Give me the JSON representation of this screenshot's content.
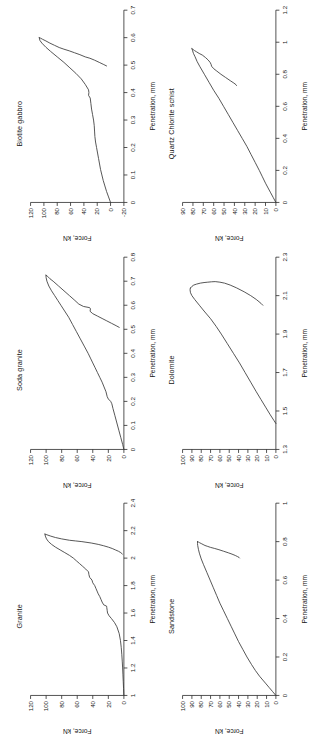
{
  "figure": {
    "rotation_deg": -90,
    "layout": "2 rows x 3 columns",
    "background": "#ffffff",
    "curve_color": "#3a3a3a",
    "axis_color": "#2b2b2b"
  },
  "axis_titles": {
    "x": "Penetration, mm",
    "y": "Force, kN"
  },
  "chart_data": [
    {
      "type": "line",
      "title": "Granite",
      "xlabel": "Penetration, mm",
      "ylabel": "Force, kN",
      "xlim": [
        1,
        2.4
      ],
      "ylim": [
        0,
        120
      ],
      "xticks": [
        1,
        1.2,
        1.4,
        1.6,
        1.8,
        2,
        2.2,
        2.4
      ],
      "xticklabels": [
        "1",
        "1.2",
        "1.4",
        "1.6",
        "1.8",
        "2",
        "2.2",
        "2.4"
      ],
      "yticks": [
        0,
        20,
        40,
        60,
        80,
        100,
        120
      ],
      "yticklabels": [
        "0",
        "20",
        "40",
        "60",
        "80",
        "100",
        "120"
      ],
      "grid": false,
      "legend": "none",
      "series": [
        {
          "name": "loading",
          "x": [
            1.0,
            1.05,
            1.1,
            1.15,
            1.2,
            1.25,
            1.3,
            1.35,
            1.4,
            1.45,
            1.5,
            1.53,
            1.56,
            1.58,
            1.6,
            1.62,
            1.64,
            1.65,
            1.66,
            1.68,
            1.7,
            1.72,
            1.74,
            1.76,
            1.78,
            1.8,
            1.82,
            1.84,
            1.86,
            1.88,
            1.9,
            1.92,
            1.94,
            1.96,
            1.98,
            2.0,
            2.02,
            2.04,
            2.06,
            2.08,
            2.1,
            2.12,
            2.14,
            2.16,
            2.175
          ],
          "y": [
            0,
            0.4,
            0.8,
            1.2,
            1.6,
            2.1,
            2.7,
            3.4,
            4.4,
            6.0,
            9.0,
            12.0,
            16.0,
            19.0,
            21.0,
            21.5,
            22.0,
            22.2,
            26.0,
            28.0,
            29.5,
            31.0,
            33.0,
            34.5,
            36.0,
            37.5,
            40.0,
            41.0,
            44.0,
            45.0,
            45.5,
            49.0,
            53.0,
            57.0,
            61.0,
            65.0,
            70.0,
            76.0,
            82.0,
            88.0,
            93.0,
            97.0,
            99.5,
            101.0,
            101.5
          ]
        },
        {
          "name": "unloading",
          "x": [
            2.175,
            2.17,
            2.16,
            2.15,
            2.14,
            2.13,
            2.125,
            2.12,
            2.11,
            2.1,
            2.09,
            2.08,
            2.07,
            2.06,
            2.05,
            2.04,
            2.03
          ],
          "y": [
            101.5,
            99.0,
            94.0,
            88.0,
            80.0,
            70.0,
            62.0,
            54.0,
            42.0,
            33.0,
            26.0,
            20.0,
            15.0,
            11.0,
            7.0,
            4.0,
            2.0
          ]
        }
      ]
    },
    {
      "type": "line",
      "title": "Soda granite",
      "xlabel": "Penetration, mm",
      "ylabel": "Force, kN",
      "xlim": [
        0,
        0.8
      ],
      "ylim": [
        0,
        120
      ],
      "xticks": [
        0,
        0.1,
        0.2,
        0.3,
        0.4,
        0.5,
        0.6,
        0.7,
        0.8
      ],
      "xticklabels": [
        "0",
        "0.1",
        "0.2",
        "0.3",
        "0.4",
        "0.5",
        "0.6",
        "0.7",
        "0.8"
      ],
      "yticks": [
        0,
        20,
        40,
        60,
        80,
        100,
        120
      ],
      "yticklabels": [
        "0",
        "20",
        "40",
        "60",
        "80",
        "100",
        "120"
      ],
      "grid": false,
      "legend": "none",
      "series": [
        {
          "name": "loading",
          "x": [
            0.0,
            0.02,
            0.05,
            0.08,
            0.11,
            0.14,
            0.17,
            0.19,
            0.2,
            0.21,
            0.22,
            0.24,
            0.26,
            0.28,
            0.3,
            0.32,
            0.34,
            0.36,
            0.38,
            0.4,
            0.43,
            0.46,
            0.49,
            0.52,
            0.55,
            0.58,
            0.6,
            0.62,
            0.64,
            0.66,
            0.68,
            0.7,
            0.715,
            0.725
          ],
          "y": [
            0,
            1.5,
            4.0,
            6.5,
            9.0,
            11.5,
            14.0,
            15.5,
            17.0,
            20.0,
            21.5,
            23.0,
            25.5,
            28.0,
            31.0,
            34.0,
            37.0,
            40.0,
            43.0,
            46.0,
            51.0,
            56.0,
            61.0,
            66.0,
            71.0,
            77.0,
            81.0,
            85.0,
            89.0,
            93.0,
            96.5,
            99.0,
            100.0,
            100.2
          ]
        },
        {
          "name": "unloading",
          "x": [
            0.725,
            0.72,
            0.71,
            0.7,
            0.68,
            0.66,
            0.64,
            0.62,
            0.605,
            0.595,
            0.59,
            0.585,
            0.575,
            0.565,
            0.555,
            0.545,
            0.535,
            0.525,
            0.515,
            0.508
          ],
          "y": [
            100.2,
            98.0,
            95.0,
            91.0,
            84.0,
            77.0,
            70.0,
            63.0,
            58.0,
            52.0,
            44.0,
            43.0,
            43.5,
            40.0,
            34.0,
            28.0,
            22.0,
            16.0,
            10.0,
            6.0
          ]
        }
      ]
    },
    {
      "type": "line",
      "title": "Biotite gabbro",
      "xlabel": "Penetration, mm",
      "ylabel": "Force, kN",
      "xlim": [
        0,
        0.7
      ],
      "ylim": [
        -20,
        120
      ],
      "xticks": [
        0,
        0.1,
        0.2,
        0.3,
        0.4,
        0.5,
        0.6,
        0.7
      ],
      "xticklabels": [
        "0",
        "0.1",
        "0.2",
        "0.3",
        "0.4",
        "0.5",
        "0.6",
        "0.7"
      ],
      "yticks": [
        -20,
        0,
        20,
        40,
        60,
        80,
        100,
        120
      ],
      "yticklabels": [
        "-20",
        "0",
        "20",
        "40",
        "60",
        "80",
        "100",
        "120"
      ],
      "grid": false,
      "legend": "none",
      "series": [
        {
          "name": "loading",
          "x": [
            0.0,
            0.02,
            0.04,
            0.06,
            0.08,
            0.1,
            0.12,
            0.14,
            0.16,
            0.18,
            0.2,
            0.22,
            0.24,
            0.26,
            0.28,
            0.3,
            0.32,
            0.34,
            0.36,
            0.38,
            0.39,
            0.4,
            0.41,
            0.43,
            0.45,
            0.47,
            0.49,
            0.51,
            0.53,
            0.55,
            0.565,
            0.58,
            0.59,
            0.6
          ],
          "y": [
            0,
            3.0,
            6.0,
            8.5,
            11.0,
            13.0,
            15.0,
            16.5,
            18.0,
            19.5,
            21.0,
            22.5,
            23.5,
            24.0,
            24.5,
            25.5,
            27.0,
            28.5,
            29.5,
            30.5,
            33.0,
            32.5,
            33.0,
            38.0,
            44.0,
            52.0,
            61.0,
            70.0,
            80.0,
            90.0,
            97.0,
            103.0,
            106.0,
            107.0
          ]
        },
        {
          "name": "unloading",
          "x": [
            0.6,
            0.598,
            0.594,
            0.588,
            0.58,
            0.572,
            0.564,
            0.558,
            0.552,
            0.545,
            0.538,
            0.53,
            0.525,
            0.518,
            0.51,
            0.503,
            0.497
          ],
          "y": [
            107.0,
            105.0,
            102.0,
            97.0,
            91.0,
            84.0,
            77.0,
            70.0,
            62.0,
            54.0,
            46.0,
            38.0,
            31.0,
            24.0,
            17.0,
            11.0,
            6.0
          ]
        }
      ]
    },
    {
      "type": "line",
      "title": "Sandstone",
      "xlabel": "Penetration, mm",
      "ylabel": "Force, kN",
      "xlim": [
        0,
        1
      ],
      "ylim": [
        0,
        100
      ],
      "xticks": [
        0,
        0.2,
        0.4,
        0.6,
        0.8,
        1
      ],
      "xticklabels": [
        "0",
        "0.2",
        "0.4",
        "0.6",
        "0.8",
        "1"
      ],
      "yticks": [
        0,
        10,
        20,
        30,
        40,
        50,
        60,
        70,
        80,
        90,
        100
      ],
      "yticklabels": [
        "0",
        "10",
        "20",
        "30",
        "40",
        "50",
        "60",
        "70",
        "80",
        "90",
        "100"
      ],
      "grid": false,
      "legend": "none",
      "series": [
        {
          "name": "loading",
          "x": [
            0.0,
            0.02,
            0.04,
            0.06,
            0.08,
            0.1,
            0.13,
            0.16,
            0.2,
            0.24,
            0.28,
            0.32,
            0.36,
            0.4,
            0.44,
            0.48,
            0.52,
            0.56,
            0.6,
            0.64,
            0.68,
            0.71,
            0.74,
            0.76,
            0.78,
            0.79,
            0.8
          ],
          "y": [
            0,
            3.5,
            7.0,
            10.5,
            14.0,
            17.5,
            22.0,
            26.0,
            31.0,
            35.5,
            40.0,
            44.0,
            48.0,
            52.0,
            56.0,
            60.0,
            63.5,
            67.0,
            70.5,
            74.0,
            77.5,
            80.0,
            82.0,
            83.0,
            83.8,
            84.0,
            84.0
          ]
        },
        {
          "name": "unloading",
          "x": [
            0.8,
            0.798,
            0.795,
            0.79,
            0.785,
            0.78,
            0.775,
            0.77,
            0.765,
            0.758,
            0.75,
            0.742,
            0.735,
            0.728,
            0.722,
            0.718,
            0.715
          ],
          "y": [
            84.0,
            83.0,
            82.0,
            80.0,
            78.0,
            76.0,
            73.0,
            70.0,
            66.0,
            61.0,
            56.0,
            51.0,
            47.0,
            43.5,
            41.0,
            39.5,
            39.0
          ]
        }
      ]
    },
    {
      "type": "line",
      "title": "Dolomite",
      "xlabel": "Penetration, mm",
      "ylabel": "Force, kN",
      "xlim": [
        1.3,
        2.3
      ],
      "ylim": [
        0,
        100
      ],
      "xticks": [
        1.3,
        1.5,
        1.7,
        1.9,
        2.1,
        2.3
      ],
      "xticklabels": [
        "1.3",
        "1.5",
        "1.7",
        "1.9",
        "2.1",
        "2.3"
      ],
      "yticks": [
        0,
        10,
        20,
        30,
        40,
        50,
        60,
        70,
        80,
        90,
        100
      ],
      "yticklabels": [
        "0",
        "10",
        "20",
        "30",
        "40",
        "50",
        "60",
        "70",
        "80",
        "90",
        "100"
      ],
      "grid": false,
      "legend": "none",
      "series": [
        {
          "name": "loading",
          "x": [
            1.435,
            1.45,
            1.48,
            1.52,
            1.56,
            1.6,
            1.65,
            1.7,
            1.75,
            1.8,
            1.85,
            1.9,
            1.94,
            1.98,
            2.02,
            2.05,
            2.08,
            2.1,
            2.115,
            2.13,
            2.14
          ],
          "y": [
            0,
            2.0,
            6.0,
            11.0,
            16.0,
            21.0,
            27.0,
            33.0,
            39.0,
            45.5,
            52.0,
            58.5,
            64.0,
            70.0,
            77.0,
            82.0,
            87.0,
            90.0,
            91.5,
            92.0,
            91.5
          ]
        },
        {
          "name": "unloading",
          "x": [
            2.14,
            2.148,
            2.155,
            2.16,
            2.165,
            2.168,
            2.17,
            2.172,
            2.173,
            2.17,
            2.165,
            2.155,
            2.14,
            2.12,
            2.1,
            2.08,
            2.06,
            2.05
          ],
          "y": [
            91.5,
            90.0,
            88.0,
            85.0,
            81.0,
            77.0,
            73.0,
            69.0,
            65.0,
            60.0,
            55.0,
            49.0,
            42.0,
            34.0,
            27.0,
            21.0,
            16.0,
            14.0
          ]
        }
      ]
    },
    {
      "type": "line",
      "title": "Quartz Chlorite schist",
      "xlabel": "Penetration, mm",
      "ylabel": "Force, kN",
      "xlim": [
        0,
        1.2
      ],
      "ylim": [
        0,
        90
      ],
      "xticks": [
        0,
        0.2,
        0.4,
        0.6,
        0.8,
        1,
        1.2
      ],
      "xticklabels": [
        "0",
        "0.2",
        "0.4",
        "0.6",
        "0.8",
        "1",
        "1.2"
      ],
      "yticks": [
        0,
        10,
        20,
        30,
        40,
        50,
        60,
        70,
        80,
        90
      ],
      "yticklabels": [
        "0",
        "10",
        "20",
        "30",
        "40",
        "50",
        "60",
        "70",
        "80",
        "90"
      ],
      "grid": false,
      "legend": "none",
      "series": [
        {
          "name": "loading",
          "x": [
            0.0,
            0.03,
            0.06,
            0.09,
            0.12,
            0.16,
            0.2,
            0.25,
            0.3,
            0.35,
            0.4,
            0.45,
            0.5,
            0.55,
            0.6,
            0.65,
            0.7,
            0.75,
            0.8,
            0.85,
            0.88,
            0.91,
            0.93,
            0.95,
            0.96
          ],
          "y": [
            0,
            2.5,
            5.0,
            7.5,
            10.0,
            13.0,
            16.0,
            20.0,
            24.0,
            28.0,
            32.5,
            37.0,
            41.5,
            46.0,
            50.5,
            55.0,
            60.0,
            64.5,
            69.0,
            73.5,
            76.0,
            78.0,
            79.5,
            80.5,
            81.0
          ]
        },
        {
          "name": "unloading",
          "x": [
            0.96,
            0.955,
            0.948,
            0.94,
            0.93,
            0.92,
            0.905,
            0.89,
            0.875,
            0.862,
            0.85,
            0.835,
            0.82,
            0.8,
            0.78,
            0.76,
            0.745,
            0.735,
            0.73
          ],
          "y": [
            81.0,
            80.0,
            78.5,
            76.5,
            74.0,
            71.0,
            68.0,
            65.5,
            63.5,
            62.5,
            62.0,
            60.0,
            57.0,
            53.0,
            48.5,
            44.0,
            40.5,
            38.5,
            38.0
          ]
        }
      ]
    }
  ]
}
